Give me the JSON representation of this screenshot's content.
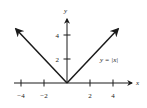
{
  "chart_data": {
    "type": "line",
    "title": "",
    "xlabel": "x",
    "ylabel": "y",
    "xlim": [
      -4.6,
      5.8
    ],
    "ylim": [
      0,
      5.8
    ],
    "x_ticks": [
      -4,
      -2,
      2,
      4
    ],
    "x_tick_labels": [
      "−4",
      "−2",
      "2",
      "4"
    ],
    "y_ticks": [
      2,
      4
    ],
    "y_tick_labels": [
      "2",
      "4"
    ],
    "grid": false,
    "legend": null,
    "annotations": [
      {
        "text": "y = |x|",
        "x": 3.2,
        "y": 2.0
      }
    ],
    "series": [
      {
        "name": "y = |x|",
        "x": [
          -4.5,
          -4,
          -2,
          0,
          2,
          4,
          4.5
        ],
        "y": [
          4.5,
          4,
          2,
          0,
          2,
          4,
          4.5
        ]
      }
    ]
  },
  "colors": {
    "ink": "#1a1a1a",
    "background": "#ffffff"
  }
}
